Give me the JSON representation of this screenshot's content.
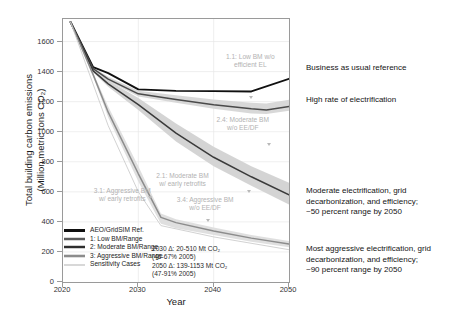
{
  "chart_data": {
    "type": "line",
    "title": "",
    "xlabel": "Year",
    "ylabel": "Total building carbon emissions\n(Million metric tons CO₂)",
    "xlim": [
      2020,
      2050
    ],
    "ylim": [
      0,
      1750
    ],
    "xticks": [
      "2020",
      "2030",
      "2040",
      "2050"
    ],
    "yticks": [
      "0",
      "200",
      "400",
      "600",
      "800",
      "1000",
      "1200",
      "1400",
      "1600"
    ],
    "grid": true,
    "legend_position": "lower-left-inside",
    "series": [
      {
        "name": "AEO/GridSIM Ref.",
        "color": "#101010",
        "x": [
          2021,
          2024,
          2026,
          2030,
          2035,
          2040,
          2045,
          2050
        ],
        "values": [
          1730,
          1430,
          1390,
          1282,
          1272,
          1270,
          1268,
          1352
        ]
      },
      {
        "name": "1: Low BM/Range",
        "color": "#4a4a4a",
        "band_color": "#d6d6d6",
        "x": [
          2021,
          2024,
          2026,
          2030,
          2035,
          2040,
          2045,
          2047,
          2050
        ],
        "values": [
          1730,
          1420,
          1350,
          1252,
          1215,
          1180,
          1152,
          1145,
          1168
        ],
        "band_upper": [
          1730,
          1428,
          1365,
          1272,
          1242,
          1215,
          1192,
          1188,
          1212
        ],
        "band_lower": [
          1730,
          1412,
          1338,
          1235,
          1192,
          1152,
          1122,
          1118,
          1140
        ]
      },
      {
        "name": "2: Moderate BM/Range",
        "color": "#3a3a3a",
        "band_color": "#d2d2d2",
        "x": [
          2021,
          2024,
          2026,
          2030,
          2035,
          2040,
          2045,
          2050
        ],
        "values": [
          1730,
          1405,
          1318,
          1180,
          990,
          830,
          700,
          580
        ],
        "band_upper": [
          1730,
          1415,
          1340,
          1225,
          1055,
          900,
          770,
          660
        ],
        "band_lower": [
          1730,
          1395,
          1300,
          1145,
          935,
          770,
          640,
          515
        ]
      },
      {
        "name": "3: Aggressive BM/Range",
        "color": "#8c8c8c",
        "band_color": "#dddddd",
        "x": [
          2021,
          2024,
          2026,
          2030,
          2033,
          2035,
          2040,
          2045,
          2050
        ],
        "values": [
          1730,
          1380,
          1130,
          720,
          430,
          395,
          340,
          292,
          252
        ],
        "band_upper": [
          1730,
          1392,
          1168,
          770,
          455,
          418,
          362,
          312,
          272
        ],
        "band_lower": [
          1730,
          1368,
          1095,
          668,
          388,
          358,
          312,
          268,
          232
        ]
      },
      {
        "name": "Sensitivity Cases",
        "color": "#cdcdcd",
        "x": [
          2021,
          2026,
          2030,
          2033,
          2040,
          2050
        ],
        "values": [
          1730,
          1040,
          600,
          375,
          300,
          215
        ]
      }
    ],
    "annotations": [
      {
        "id": "1.1",
        "text": "1.1: Low BM w/o\nefficient EL",
        "x": 2045,
        "y": 1450
      },
      {
        "id": "2.4",
        "text": "2.4: Moderate BM\nw/o EE/DF",
        "x": 2044,
        "y": 1030
      },
      {
        "id": "2.1",
        "text": "2.1: Moderate BM\nw/ early retrofits",
        "x": 2036,
        "y": 660
      },
      {
        "id": "3.1",
        "text": "3.1: Aggressive BM\nw/ early retrofits",
        "x": 2028,
        "y": 560
      },
      {
        "id": "3.4",
        "text": "3.4: Aggressive BM\nw/o EE/DF",
        "x": 2039,
        "y": 500
      }
    ],
    "delta_note": "2030 Δ: 20-510 Mt CO₂\n(46-67% 2005)\n2050 Δ: 139-1153 Mt CO₂\n(47-91% 2005)"
  },
  "legend": {
    "items": [
      {
        "label": "AEO/GridSIM Ref.",
        "color": "#101010",
        "band": ""
      },
      {
        "label": "1: Low BM/Range",
        "color": "#5a5a5a",
        "band": "#d6d6d6"
      },
      {
        "label": "2: Moderate BM/Range",
        "color": "#2e2e2e",
        "band": "#cfcfcf"
      },
      {
        "label": "3: Aggressive BM/Range",
        "color": "#8c8c8c",
        "band": "#dedede"
      },
      {
        "label": "Sensitivity Cases",
        "color": "#d8d8d8",
        "band": ""
      }
    ]
  },
  "side_annotations": [
    {
      "text": "Business as usual reference",
      "top": 63
    },
    {
      "text": "High rate of electrification",
      "top": 95
    },
    {
      "text": "Moderate electrification, grid\ndecarbonization, and efficiency;\n~50 percent range by 2050",
      "top": 186
    },
    {
      "text": "Most aggressive electrification, grid\ndecarbonization, and efficiency;\n~90 percent range by 2050",
      "top": 244
    }
  ]
}
